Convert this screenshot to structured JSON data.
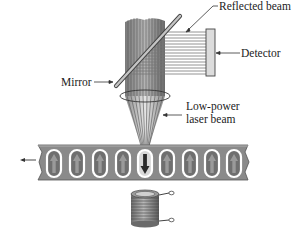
{
  "labels": {
    "reflected_beam": "Reflected beam",
    "detector": "Detector",
    "mirror": "Mirror",
    "low_power_line1": "Low-power",
    "low_power_line2": "laser beam"
  },
  "tape": {
    "domain_count": 9,
    "domains": [
      "up",
      "up",
      "up",
      "up",
      "down",
      "up",
      "up",
      "up",
      "up"
    ],
    "motion_direction": "left"
  },
  "colors": {
    "tape": "#8a8a8a",
    "tape_dark": "#6e6e6e",
    "domain_outline": "#ffffff",
    "arrow_up": "#777777",
    "arrow_down": "#333333",
    "beam": "#9a9a9a",
    "beam_line": "#555555",
    "detector": "#d9d9d9",
    "coil": "#8c8c8c"
  }
}
